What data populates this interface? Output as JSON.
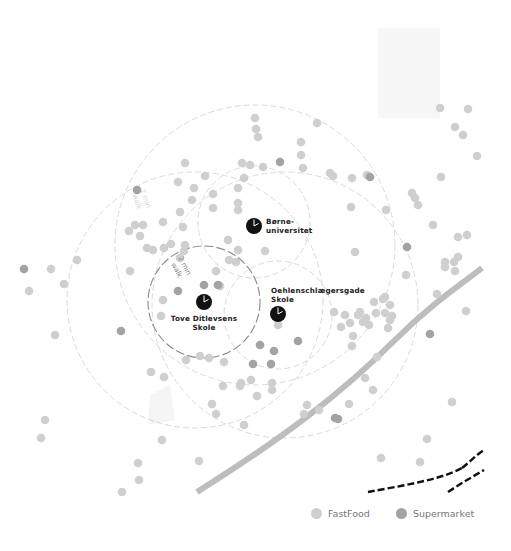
{
  "map": {
    "colors": {
      "background": "#ffffff",
      "fastfood": "#cfcfcf",
      "supermarket": "#a3a3a3",
      "school_marker": "#111111",
      "road": "#bdbdbd",
      "railway": "#111111",
      "circle_outer": "#d6d6d6",
      "circle_inner": "#8a8a8a"
    },
    "schools": [
      {
        "id": "borne",
        "name_lines": [
          "Børne-",
          "universitet"
        ],
        "icon": "clock-icon"
      },
      {
        "id": "oehlen",
        "name_lines": [
          "Oehlenschlægersgade",
          "Skole"
        ],
        "icon": "clock-icon"
      },
      {
        "id": "tove",
        "name_lines": [
          "Tove Ditlevsens",
          "Skole"
        ],
        "icon": "clock-icon"
      }
    ],
    "walk_labels": [
      {
        "lines": [
          "2 min",
          "walk"
        ]
      }
    ],
    "legend": {
      "items": [
        {
          "label": "FastFood",
          "color": "#cfcfcf"
        },
        {
          "label": "Supermarket",
          "color": "#a3a3a3"
        }
      ]
    },
    "points": {
      "fastfood_count": 139,
      "supermarket_count": 17
    }
  }
}
